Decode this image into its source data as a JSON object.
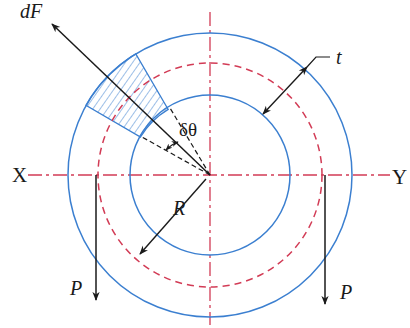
{
  "diagram": {
    "colors": {
      "ring": "#3b7fd0",
      "centerline": "#d23b55",
      "force": "#1a1a1a",
      "hatch": "#3b7fd0"
    },
    "geometry": {
      "center": [
        210,
        175
      ],
      "outer_radius": 142,
      "mean_radius": 112,
      "inner_radius": 80
    },
    "labels": {
      "dF": "dF",
      "dtheta": "δθ",
      "t": "t",
      "R": "R",
      "X": "X",
      "Y": "Y",
      "P_left": "P",
      "P_right": "P"
    },
    "elements": [
      {
        "id": "outer-circle",
        "type": "circle",
        "style": "solid blue"
      },
      {
        "id": "inner-circle",
        "type": "circle",
        "style": "solid blue"
      },
      {
        "id": "mean-circle",
        "type": "circle",
        "style": "dashed red"
      },
      {
        "id": "x-y-axis",
        "type": "line",
        "style": "dash-dot red",
        "from": "X",
        "to": "Y"
      },
      {
        "id": "vertical-axis",
        "type": "line",
        "style": "dash-dot red"
      },
      {
        "id": "hatched-element",
        "type": "sector",
        "style": "hatched blue",
        "angular_width": "δθ"
      },
      {
        "id": "dF-arrow",
        "type": "arrow",
        "label": "dF",
        "direction": "radially outward"
      },
      {
        "id": "t-dimension",
        "type": "double-arrow",
        "label": "t"
      },
      {
        "id": "R-dimension",
        "type": "arrow",
        "label": "R"
      },
      {
        "id": "P-left-arrow",
        "type": "arrow",
        "label": "P",
        "direction": "down"
      },
      {
        "id": "P-right-arrow",
        "type": "arrow",
        "label": "P",
        "direction": "down"
      }
    ]
  }
}
